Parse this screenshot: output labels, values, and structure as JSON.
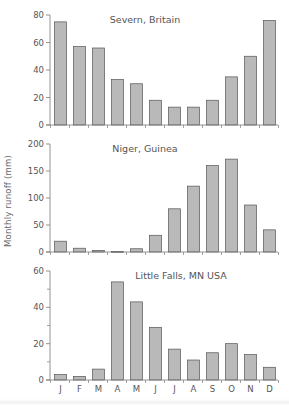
{
  "figure": {
    "ylabel": "Monthly runoff (mm)",
    "months": [
      "J",
      "F",
      "M",
      "A",
      "M",
      "J",
      "J",
      "A",
      "S",
      "O",
      "N",
      "D"
    ]
  },
  "colors": {
    "bar_fill": "#b9b9b9",
    "bar_stroke": "#555555",
    "axis": "#7a7a7a",
    "text": "#555555"
  },
  "chart_data": [
    {
      "type": "bar",
      "title": "Severn, Britain",
      "categories": [
        "J",
        "F",
        "M",
        "A",
        "M",
        "J",
        "J",
        "A",
        "S",
        "O",
        "N",
        "D"
      ],
      "values": [
        75,
        57,
        56,
        33,
        30,
        18,
        13,
        13,
        18,
        35,
        50,
        76
      ],
      "xlabel": "",
      "ylabel": "Monthly runoff (mm)",
      "ylim": [
        0,
        80
      ],
      "yticks": [
        0,
        20,
        40,
        60,
        80
      ],
      "minor_yticks": [],
      "grid": false,
      "legend": null
    },
    {
      "type": "bar",
      "title": "Niger, Guinea",
      "categories": [
        "J",
        "F",
        "M",
        "A",
        "M",
        "J",
        "J",
        "A",
        "S",
        "O",
        "N",
        "D"
      ],
      "values": [
        20,
        7,
        3,
        1,
        6,
        31,
        80,
        122,
        160,
        172,
        87,
        41
      ],
      "xlabel": "",
      "ylabel": "Monthly runoff (mm)",
      "ylim": [
        0,
        200
      ],
      "yticks": [
        0,
        50,
        100,
        150,
        200
      ],
      "minor_yticks": [],
      "grid": false,
      "legend": null
    },
    {
      "type": "bar",
      "title": "Little Falls, MN USA",
      "categories": [
        "J",
        "F",
        "M",
        "A",
        "M",
        "J",
        "J",
        "A",
        "S",
        "O",
        "N",
        "D"
      ],
      "values": [
        3,
        2,
        6,
        54,
        43,
        29,
        17,
        11,
        15,
        20,
        14,
        7
      ],
      "xlabel": "",
      "ylabel": "Monthly runoff (mm)",
      "ylim": [
        0,
        60
      ],
      "yticks": [
        0,
        20,
        40,
        60
      ],
      "minor_yticks": [
        10,
        30,
        50
      ],
      "grid": false,
      "legend": null,
      "show_month_labels": true
    }
  ]
}
